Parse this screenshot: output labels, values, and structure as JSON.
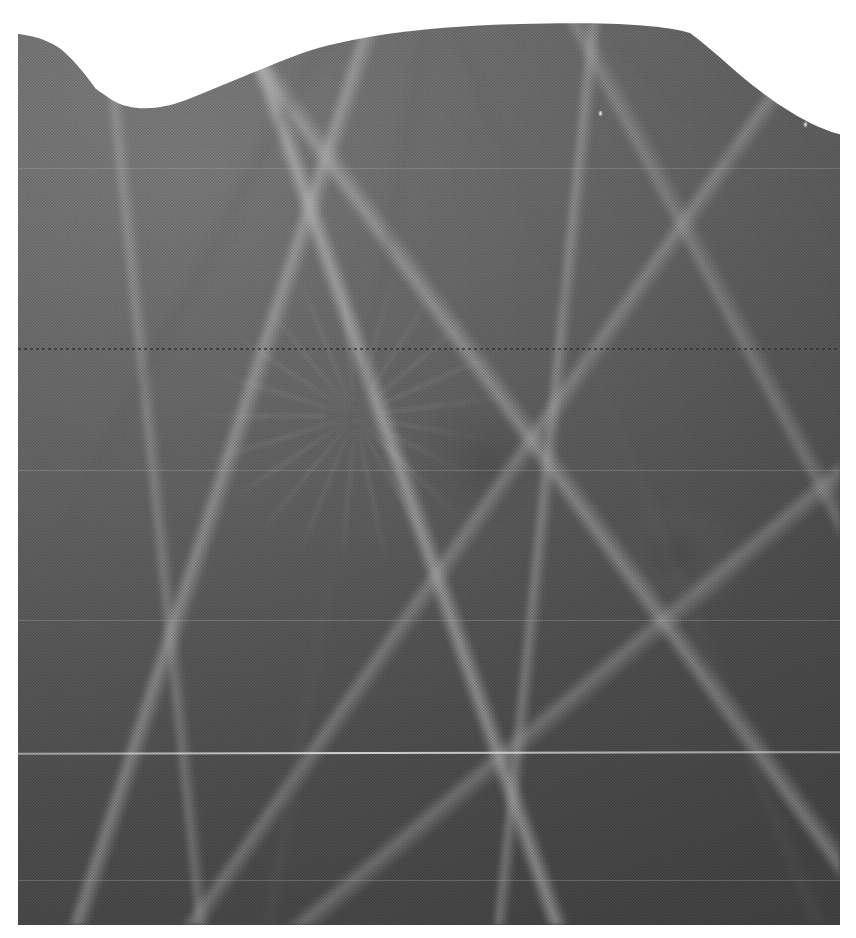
{
  "document": {
    "type": "radiograph",
    "modality": "mammography",
    "view_description": "magnified mammographic detail of fibroglandular breast tissue",
    "caption": "",
    "label": ""
  },
  "plate": {
    "left": 18,
    "top": 0,
    "width": 822,
    "height": 925,
    "background_color": "#ffffff",
    "tissue_mid_tone": "#9a9a9a",
    "tissue_light_tone": "#c4c4c4",
    "tissue_dark_tone": "#6a6a6a"
  },
  "tissue_boundary": {
    "name": "skin-line",
    "description": "upper tissue border rising from lower-left, a V-shaped notch, a broad plateau, then falling to the right",
    "notch_point": {
      "x": 100,
      "y": 95
    },
    "plateau_top": {
      "y": 28
    },
    "plateau_from_x": 262,
    "plateau_to_x": 690,
    "left_start": {
      "x": 18,
      "y": 38
    },
    "right_end": {
      "x": 840,
      "y": 132
    }
  },
  "features": [
    {
      "name": "dominant-mass",
      "cx": 0.57,
      "cy": 0.5,
      "tone": "dark",
      "label": ""
    },
    {
      "name": "secondary-mass",
      "cx": 0.8,
      "cy": 0.6,
      "tone": "dark",
      "label": ""
    },
    {
      "name": "spiculated-fan",
      "cx": 0.41,
      "cy": 0.45,
      "tone": "light",
      "label": ""
    }
  ],
  "artifacts": {
    "scanline_dark_y": 348,
    "scanline_light_y": 752,
    "faint_lines_y": [
      168,
      470,
      620,
      880
    ],
    "specks": [
      {
        "x": 803,
        "y": 121
      },
      {
        "x": 598,
        "y": 110
      }
    ],
    "halftone_pattern": "45-degree screen, 3px pitch"
  },
  "margins": {
    "left": 18,
    "right": 16,
    "bottom": 13,
    "color": "#ffffff"
  }
}
